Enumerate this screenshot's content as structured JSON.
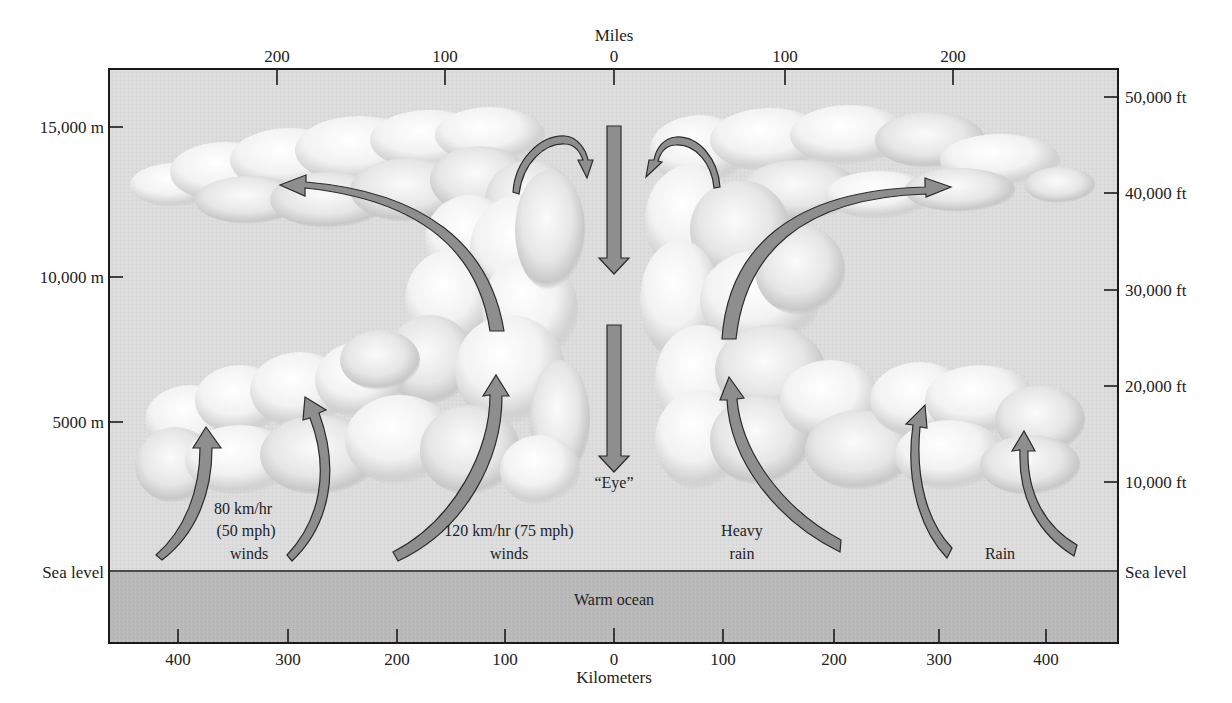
{
  "figure": {
    "top_axis": {
      "title": "Miles",
      "ticks": [
        {
          "label": "200",
          "x": 277
        },
        {
          "label": "100",
          "x": 445
        },
        {
          "label": "0",
          "x": 614
        },
        {
          "label": "100",
          "x": 785
        },
        {
          "label": "200",
          "x": 953
        }
      ]
    },
    "bottom_axis": {
      "title": "Kilometers",
      "ticks": [
        {
          "label": "400",
          "x": 178
        },
        {
          "label": "300",
          "x": 288
        },
        {
          "label": "200",
          "x": 397
        },
        {
          "label": "100",
          "x": 505
        },
        {
          "label": "0",
          "x": 614
        },
        {
          "label": "100",
          "x": 723
        },
        {
          "label": "200",
          "x": 834
        },
        {
          "label": "300",
          "x": 939
        },
        {
          "label": "400",
          "x": 1046
        }
      ]
    },
    "left_axis": {
      "ticks": [
        {
          "label": "15,000 m",
          "y": 127
        },
        {
          "label": "10,000 m",
          "y": 277
        },
        {
          "label": "5000 m",
          "y": 422
        }
      ],
      "sea_level_label": "Sea level"
    },
    "right_axis": {
      "ticks": [
        {
          "label": "50,000 ft",
          "y": 97
        },
        {
          "label": "40,000 ft",
          "y": 193
        },
        {
          "label": "30,000 ft",
          "y": 290
        },
        {
          "label": "20,000 ft",
          "y": 386
        },
        {
          "label": "10,000 ft",
          "y": 482
        }
      ],
      "sea_level_label": "Sea level"
    },
    "annotations": {
      "outer_winds_line1": "80 km/hr",
      "outer_winds_line2": "(50 mph)",
      "outer_winds_line3": "winds",
      "inner_winds_line1": "120 km/hr (75 mph)",
      "inner_winds_line2": "winds",
      "eye": "“Eye”",
      "heavy_rain_line1": "Heavy",
      "heavy_rain_line2": "rain",
      "rain": "Rain",
      "ocean": "Warm ocean"
    },
    "colors": {
      "sky": "#dcdcdc",
      "ocean": "#b9b9b9",
      "arrow_fill": "#8e8e8e",
      "arrow_stroke": "#2b2b2b",
      "cloud_light": "#ffffff",
      "cloud_shadow": "#b4b4b4"
    }
  }
}
